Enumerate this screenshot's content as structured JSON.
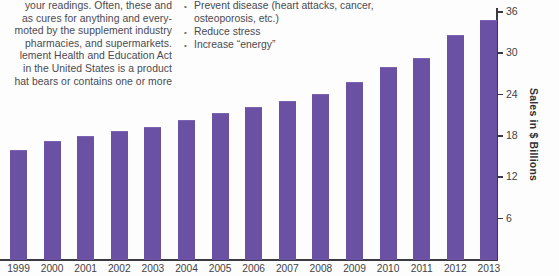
{
  "page": {
    "background_color": "#fdfdfd",
    "text_color": "#4a4a52"
  },
  "body_text": {
    "left_column_lines": [
      "your readings. Often, these and",
      "as cures for anything and every-",
      "moted by the supplement industry",
      "pharmacies, and supermarkets.",
      "lement Health and Education Act",
      "in the United States is a product",
      "hat bears or contains one or more"
    ],
    "right_column_bullets": [
      {
        "marker": "•",
        "line1": "Prevent disease (heart attacks, cancer,",
        "line2": "osteoporosis, etc.)"
      },
      {
        "marker": "•",
        "line1": "Reduce stress",
        "line2": ""
      },
      {
        "marker": "•",
        "line1": "Increase “energy”",
        "line2": ""
      }
    ]
  },
  "chart_data": {
    "type": "bar",
    "title": "",
    "xlabel": "",
    "ylabel": "Sales in $ Billions",
    "ylim": [
      0,
      36
    ],
    "grid": false,
    "legend": "none",
    "bar_color": "#6a51a3",
    "axis_color": "#3a3a42",
    "ytick_values": [
      6,
      12,
      18,
      24,
      30,
      36
    ],
    "ytick_labels": [
      "6",
      "12",
      "18",
      "24",
      "30",
      "36"
    ],
    "categories": [
      "1999",
      "2000",
      "2001",
      "2002",
      "2003",
      "2004",
      "2005",
      "2006",
      "2007",
      "2008",
      "2009",
      "2010",
      "2011",
      "2012",
      "2013"
    ],
    "values": [
      15.8,
      17.1,
      17.8,
      18.6,
      19.2,
      20.2,
      21.2,
      22.0,
      23.0,
      24.0,
      25.7,
      27.9,
      29.2,
      32.5,
      34.7
    ]
  }
}
